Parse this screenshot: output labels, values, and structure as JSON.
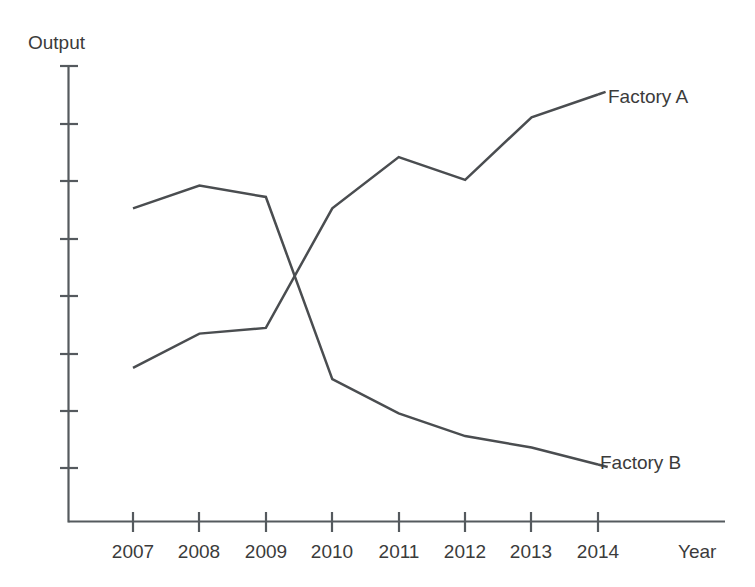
{
  "chart_data": {
    "type": "line",
    "title": "",
    "subtitle": "",
    "xlabel": "Year",
    "ylabel": "Output",
    "grid": false,
    "legend_position": "inline-end-of-line",
    "x": [
      "2007",
      "2008",
      "2009",
      "2010",
      "2011",
      "2012",
      "2013",
      "2014"
    ],
    "categories": [
      "2007",
      "2008",
      "2009",
      "2010",
      "2011",
      "2012",
      "2013",
      "2014"
    ],
    "xlim": [
      "2007",
      "2014"
    ],
    "ylim": [
      0,
      8
    ],
    "y_axis_ticks_labeled": false,
    "y_tick_count": 8,
    "series": [
      {
        "name": "Factory A",
        "color": "#4a4d50",
        "values": [
          2.7,
          3.3,
          3.4,
          5.5,
          6.4,
          6.0,
          7.1,
          7.5
        ],
        "label_text": "Factory A"
      },
      {
        "name": "Factory B",
        "color": "#4a4d50",
        "values": [
          5.5,
          5.9,
          5.7,
          2.5,
          1.9,
          1.5,
          1.3,
          1.0
        ],
        "label_text": "Factory B"
      }
    ]
  },
  "axes": {
    "y_title": "Output",
    "x_title": "Year",
    "x_tick_labels": [
      "2007",
      "2008",
      "2009",
      "2010",
      "2011",
      "2012",
      "2013",
      "2014"
    ],
    "axis_color": "#555a5e"
  },
  "series_labels": {
    "factory_a": "Factory A",
    "factory_b": "Factory B"
  },
  "colors": {
    "background": "#ffffff",
    "axis": "#555a5e",
    "line": "#4a4d50",
    "text": "#3b3b3b"
  }
}
